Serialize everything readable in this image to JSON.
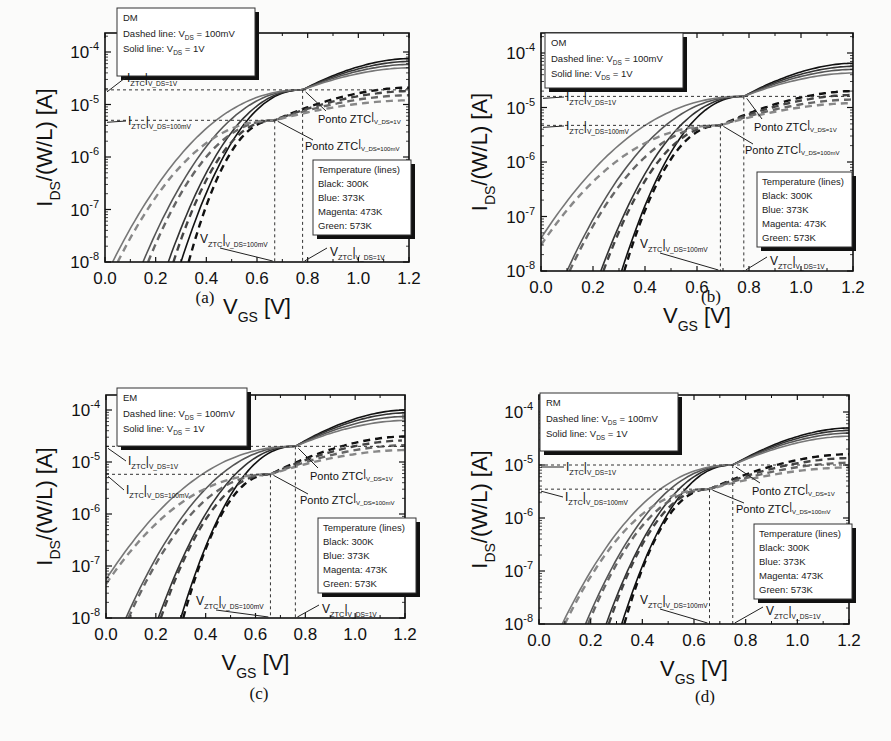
{
  "figure": {
    "panels": [
      {
        "id": "a",
        "caption": "(a)",
        "mode_label": "DM",
        "legend_top": [
          "DM",
          "Dashed line: V_DS = 100mV",
          "Solid line: V_DS = 1V"
        ],
        "legend_temp": [
          "Temperature (lines)",
          "Black: 300K",
          "Blue: 373K",
          "Magenta: 473K",
          "Green: 573K"
        ],
        "annotations": {
          "iztc_1v": "I_ZTC|V_DS=1V",
          "iztc_100mv": "I_ZTC|V_DS=100mV",
          "ponto_1v": "Ponto ZTC|V_DS=1V",
          "ponto_100mv": "Ponto ZTC|V_DS=100mV",
          "vztc_100mv": "V_ZTC|V_DS=100mV",
          "vztc_1v": "V_ZTC|V_DS=1V"
        }
      },
      {
        "id": "b",
        "caption": "(b)",
        "mode_label": "OM",
        "legend_top": [
          "OM",
          "Dashed line: V_DS = 100mV",
          "Solid line: V_DS = 1V"
        ],
        "legend_temp": [
          "Temperature (lines)",
          "Black: 300K",
          "Blue: 373K",
          "Magenta: 473K",
          "Green: 573K"
        ]
      },
      {
        "id": "c",
        "caption": "(c)",
        "mode_label": "EM",
        "legend_top": [
          "EM",
          "Dashed line: V_DS = 100mV",
          "Solid line: V_DS = 1V"
        ],
        "legend_temp": [
          "Temperature (lines)",
          "Black: 300K",
          "Blue: 373K",
          "Magenta: 473K",
          "Green: 573K"
        ]
      },
      {
        "id": "d",
        "caption": "(d)",
        "mode_label": "RM",
        "legend_top": [
          "RM",
          "Dashed line: V_DS = 100mV",
          "Solid line: V_DS = 1V"
        ],
        "legend_temp": [
          "Temperature (lines)",
          "Black: 300K",
          "Blue: 373K",
          "Magenta: 473K",
          "Green: 573K"
        ]
      }
    ],
    "axis": {
      "xlabel": "V_GS [V]",
      "ylabel": "I_DS/(W/L) [A]",
      "xticks": [
        "0.0",
        "0.2",
        "0.4",
        "0.6",
        "0.8",
        "1.0",
        "1.2"
      ],
      "yticks": [
        "10^-8",
        "10^-7",
        "10^-6",
        "10^-5",
        "10^-4"
      ]
    }
  },
  "chart_data": [
    {
      "panel": "a",
      "type": "line",
      "title": "DM",
      "xlabel": "V_GS [V]",
      "ylabel": "I_DS/(W/L) [A]",
      "xlim": [
        0.0,
        1.2
      ],
      "ylim": [
        1e-08,
        0.00023
      ],
      "yscale": "log",
      "legend": [
        "Black: 300K",
        "Blue: 373K",
        "Magenta: 473K",
        "Green: 573K"
      ],
      "series_style": {
        "dashed": "V_DS = 100mV",
        "solid": "V_DS = 1V"
      },
      "ztc": {
        "vds_1v": {
          "vgs": 0.78,
          "ids": 1.9e-05
        },
        "vds_100mv": {
          "vgs": 0.67,
          "ids": 5e-06
        }
      },
      "series": [
        {
          "name": "300K solid (1V)",
          "x0": 0.3,
          "end": 7.5e-05,
          "dashed": false,
          "color": "#111111"
        },
        {
          "name": "373K solid (1V)",
          "x0": 0.25,
          "end": 6.6e-05,
          "dashed": false,
          "color": "#333333"
        },
        {
          "name": "473K solid (1V)",
          "x0": 0.15,
          "end": 5.8e-05,
          "dashed": false,
          "color": "#555555"
        },
        {
          "name": "573K solid (1V)",
          "x0": 0.03,
          "end": 5e-05,
          "dashed": false,
          "color": "#777777"
        },
        {
          "name": "300K dashed (100mV)",
          "x0": 0.33,
          "end": 2.1e-05,
          "dashed": true,
          "color": "#111111"
        },
        {
          "name": "373K dashed (100mV)",
          "x0": 0.27,
          "end": 1.8e-05,
          "dashed": true,
          "color": "#444444"
        },
        {
          "name": "473K dashed (100mV)",
          "x0": 0.17,
          "end": 1.5e-05,
          "dashed": true,
          "color": "#666666"
        },
        {
          "name": "573K dashed (100mV)",
          "x0": 0.05,
          "end": 1.2e-05,
          "dashed": true,
          "color": "#888888"
        }
      ]
    },
    {
      "panel": "b",
      "type": "line",
      "title": "OM",
      "xlabel": "V_GS [V]",
      "ylabel": "I_DS/(W/L) [A]",
      "xlim": [
        0.0,
        1.2
      ],
      "ylim": [
        1e-08,
        0.00023
      ],
      "yscale": "log",
      "legend": [
        "Black: 300K",
        "Blue: 373K",
        "Magenta: 473K",
        "Green: 573K"
      ],
      "ztc": {
        "vds_1v": {
          "vgs": 0.78,
          "ids": 1.6e-05
        },
        "vds_100mv": {
          "vgs": 0.69,
          "ids": 4.7e-06
        }
      },
      "series": [
        {
          "name": "300K solid (1V)",
          "x0": 0.31,
          "end": 6.5e-05,
          "dashed": false,
          "color": "#111111"
        },
        {
          "name": "373K solid (1V)",
          "x0": 0.23,
          "end": 5.7e-05,
          "dashed": false,
          "color": "#333333"
        },
        {
          "name": "473K solid (1V)",
          "x0": 0.1,
          "end": 5e-05,
          "dashed": false,
          "color": "#555555"
        },
        {
          "name": "573K solid (1V)",
          "x0": -0.2,
          "start_ids": 4e-08,
          "end": 4.3e-05,
          "dashed": false,
          "color": "#777777"
        },
        {
          "name": "300K dashed (100mV)",
          "x0": 0.32,
          "end": 2e-05,
          "dashed": true,
          "color": "#111111"
        },
        {
          "name": "373K dashed (100mV)",
          "x0": 0.24,
          "end": 1.7e-05,
          "dashed": true,
          "color": "#444444"
        },
        {
          "name": "473K dashed (100mV)",
          "x0": 0.11,
          "end": 1.4e-05,
          "dashed": true,
          "color": "#666666"
        },
        {
          "name": "573K dashed (100mV)",
          "x0": -0.2,
          "start_ids": 3e-08,
          "end": 1.2e-05,
          "dashed": true,
          "color": "#888888"
        }
      ]
    },
    {
      "panel": "c",
      "type": "line",
      "title": "EM",
      "xlabel": "V_GS [V]",
      "ylabel": "I_DS/(W/L) [A]",
      "xlim": [
        0.0,
        1.2
      ],
      "ylim": [
        1e-08,
        0.0002
      ],
      "yscale": "log",
      "legend": [
        "Black: 300K",
        "Blue: 373K",
        "Magenta: 473K",
        "Green: 573K"
      ],
      "ztc": {
        "vds_1v": {
          "vgs": 0.76,
          "ids": 2e-05
        },
        "vds_100mv": {
          "vgs": 0.66,
          "ids": 5.8e-06
        }
      },
      "series": [
        {
          "name": "300K solid (1V)",
          "x0": 0.3,
          "end": 0.0001,
          "dashed": false,
          "color": "#111111"
        },
        {
          "name": "373K solid (1V)",
          "x0": 0.21,
          "end": 8.8e-05,
          "dashed": false,
          "color": "#333333"
        },
        {
          "name": "473K solid (1V)",
          "x0": 0.08,
          "end": 7.5e-05,
          "dashed": false,
          "color": "#555555"
        },
        {
          "name": "573K solid (1V)",
          "x0": -0.25,
          "start_ids": 5.5e-08,
          "end": 6.3e-05,
          "dashed": false,
          "color": "#777777"
        },
        {
          "name": "300K dashed (100mV)",
          "x0": 0.31,
          "end": 3.1e-05,
          "dashed": true,
          "color": "#111111"
        },
        {
          "name": "373K dashed (100mV)",
          "x0": 0.22,
          "end": 2.6e-05,
          "dashed": true,
          "color": "#444444"
        },
        {
          "name": "473K dashed (100mV)",
          "x0": 0.09,
          "end": 2.1e-05,
          "dashed": true,
          "color": "#666666"
        },
        {
          "name": "573K dashed (100mV)",
          "x0": -0.25,
          "start_ids": 4.5e-08,
          "end": 1.7e-05,
          "dashed": true,
          "color": "#888888"
        }
      ]
    },
    {
      "panel": "d",
      "type": "line",
      "title": "RM",
      "xlabel": "V_GS [V]",
      "ylabel": "I_DS/(W/L) [A]",
      "xlim": [
        0.0,
        1.2
      ],
      "ylim": [
        1e-08,
        0.0002
      ],
      "yscale": "log",
      "legend": [
        "Black: 300K",
        "Blue: 373K",
        "Magenta: 473K",
        "Green: 573K"
      ],
      "ztc": {
        "vds_1v": {
          "vgs": 0.75,
          "ids": 1e-05
        },
        "vds_100mv": {
          "vgs": 0.66,
          "ids": 3.5e-06
        }
      },
      "series": [
        {
          "name": "300K solid (1V)",
          "x0": 0.32,
          "end": 5e-05,
          "dashed": false,
          "color": "#111111"
        },
        {
          "name": "373K solid (1V)",
          "x0": 0.26,
          "end": 4.5e-05,
          "dashed": false,
          "color": "#333333"
        },
        {
          "name": "473K solid (1V)",
          "x0": 0.18,
          "end": 4e-05,
          "dashed": false,
          "color": "#555555"
        },
        {
          "name": "573K solid (1V)",
          "x0": 0.09,
          "end": 3.5e-05,
          "dashed": false,
          "color": "#777777"
        },
        {
          "name": "300K dashed (100mV)",
          "x0": 0.33,
          "end": 1.6e-05,
          "dashed": true,
          "color": "#111111"
        },
        {
          "name": "373K dashed (100mV)",
          "x0": 0.27,
          "end": 1.35e-05,
          "dashed": true,
          "color": "#444444"
        },
        {
          "name": "473K dashed (100mV)",
          "x0": 0.19,
          "end": 1.1e-05,
          "dashed": true,
          "color": "#666666"
        },
        {
          "name": "573K dashed (100mV)",
          "x0": 0.1,
          "end": 9e-06,
          "dashed": true,
          "color": "#888888"
        }
      ]
    }
  ]
}
